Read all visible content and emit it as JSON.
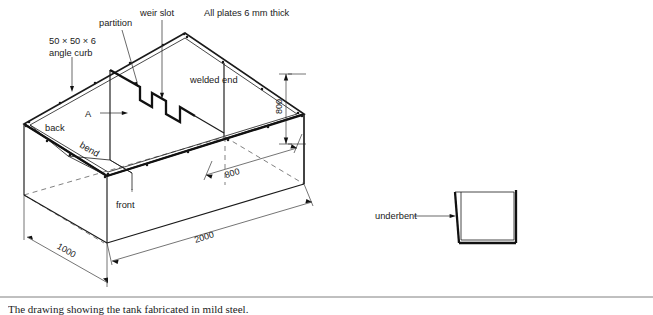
{
  "figure": {
    "type": "isometric-engineering-drawing",
    "notes": {
      "plate_thickness": "All plates 6 mm thick"
    },
    "labels": {
      "angle_curb_line1": "50 × 50 × 6",
      "angle_curb_line2": "angle curb",
      "partition": "partition",
      "weir_slot": "weir slot",
      "welded_end": "welded end",
      "back": "back",
      "front": "front",
      "bend": "bend",
      "section_marker": "A",
      "underbent": "underbent"
    },
    "dimensions": [
      {
        "name": "height",
        "value": "800",
        "orientation": "vertical",
        "units": "mm"
      },
      {
        "name": "width",
        "value": "800",
        "orientation": "isometric-right",
        "units": "mm"
      },
      {
        "name": "length",
        "value": "2000",
        "orientation": "isometric-right",
        "units": "mm"
      },
      {
        "name": "depth",
        "value": "1000",
        "orientation": "isometric-left",
        "units": "mm"
      }
    ],
    "detail_view": {
      "name": "underbent-detail",
      "description": "U-channel cross-section with left wall bent outward"
    },
    "caption_clipped": "The drawing showing the tank fabricated in mild steel."
  },
  "colors": {
    "line": "#1a1a1a",
    "heavy_line": "#111111",
    "hidden_line": "#4a4a4a",
    "dimension_line": "#2a2a2a",
    "rule": "#808080",
    "background": "#ffffff"
  }
}
